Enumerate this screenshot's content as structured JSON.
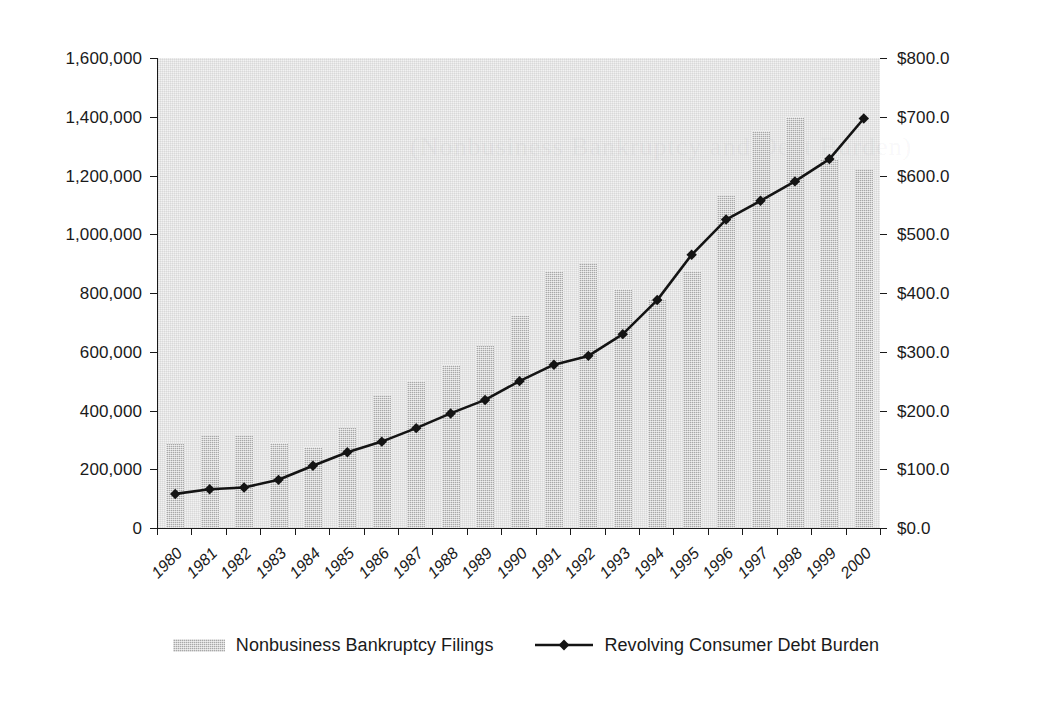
{
  "chart_data": {
    "type": "bar",
    "title": "",
    "xlabel": "",
    "ylabel": "",
    "grid": false,
    "legend_position": "bottom-center",
    "categories": [
      "1980",
      "1981",
      "1982",
      "1983",
      "1984",
      "1985",
      "1986",
      "1987",
      "1988",
      "1989",
      "1990",
      "1991",
      "1992",
      "1993",
      "1994",
      "1995",
      "1996",
      "1997",
      "1998",
      "1999",
      "2000"
    ],
    "axes": {
      "left": {
        "label": "",
        "ylim": [
          0,
          1600000
        ],
        "tick_values": [
          0,
          200000,
          400000,
          600000,
          800000,
          1000000,
          1200000,
          1400000,
          1600000
        ],
        "tick_labels": [
          "0",
          "200,000",
          "400,000",
          "600,000",
          "800,000",
          "1,000,000",
          "1,200,000",
          "1,400,000",
          "1,600,000"
        ]
      },
      "right": {
        "label": "",
        "ylim": [
          0,
          800
        ],
        "tick_values": [
          0,
          100,
          200,
          300,
          400,
          500,
          600,
          700,
          800
        ],
        "tick_labels": [
          "$0.0",
          "$100.0",
          "$200.0",
          "$300.0",
          "$400.0",
          "$500.0",
          "$600.0",
          "$700.0",
          "$800.0"
        ]
      }
    },
    "series": [
      {
        "name": "Nonbusiness Bankruptcy Filings",
        "type": "bar",
        "axis": "left",
        "color": "#a8a8a8",
        "values": [
          287000,
          315000,
          315000,
          290000,
          275000,
          340000,
          450000,
          500000,
          555000,
          620000,
          725000,
          875000,
          900000,
          815000,
          780000,
          875000,
          1130000,
          1350000,
          1400000,
          1255000,
          1220000
        ]
      },
      {
        "name": "Revolving Consumer Debt Burden",
        "type": "line",
        "axis": "right",
        "color": "#141414",
        "marker": "diamond",
        "values": [
          58,
          66,
          69,
          82,
          106,
          129,
          147,
          170,
          195,
          218,
          250,
          278,
          293,
          330,
          388,
          465,
          525,
          557,
          590,
          628,
          697
        ]
      }
    ]
  },
  "legend": {
    "entries": [
      {
        "label": "Nonbusiness Bankruptcy Filings",
        "icon": "bar-swatch-icon"
      },
      {
        "label": "Revolving Consumer Debt Burden",
        "icon": "line-diamond-swatch-icon"
      }
    ]
  },
  "watermark": {
    "text": "(Nonbusiness Bankruptcy and Debt Burden)"
  }
}
